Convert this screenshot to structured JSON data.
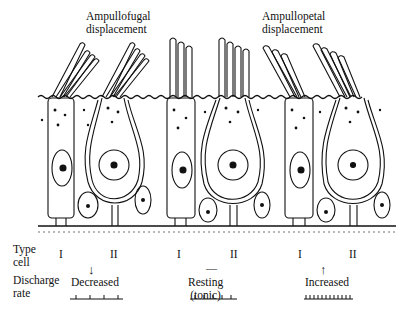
{
  "figure": {
    "headings": {
      "left": [
        "Ampullofugal",
        "displacement"
      ],
      "right": [
        "Ampullopetal",
        "displacement"
      ]
    },
    "row_labels": {
      "type_cell": [
        "Type",
        "cell"
      ],
      "discharge_rate": [
        "Discharge",
        "rate"
      ]
    },
    "panels": [
      {
        "name": "ampullofugal",
        "cell_types": [
          "I",
          "II"
        ],
        "direction": "down-arrow",
        "rate_label": [
          "Decreased"
        ],
        "spike_count": 4
      },
      {
        "name": "resting",
        "cell_types": [
          "I",
          "II"
        ],
        "direction": "dash",
        "rate_label": [
          "Resting",
          "(tonic)"
        ],
        "spike_count": 5
      },
      {
        "name": "ampullopetal",
        "cell_types": [
          "I",
          "II"
        ],
        "direction": "up-arrow",
        "rate_label": [
          "Increased"
        ],
        "spike_count": 12
      }
    ],
    "symbols": {
      "down": "↓",
      "dash": "—",
      "up": "↑"
    },
    "colors": {
      "ink": "#111111",
      "background": "#ffffff"
    }
  }
}
